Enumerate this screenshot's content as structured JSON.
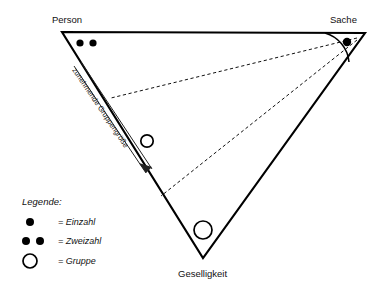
{
  "figure": {
    "type": "triangle-model-diagram",
    "background_color": "#ffffff",
    "line_color": "#000000"
  },
  "vertices": {
    "top_left": {
      "label": "Person",
      "symbol": "zweizahl",
      "symbol_description": "two filled dots",
      "x": 62,
      "y": 32
    },
    "top_right": {
      "label": "Sache",
      "symbol": "einzahl",
      "symbol_description": "one filled dot",
      "x": 365,
      "y": 33
    },
    "bottom": {
      "label": "Geselligkeit",
      "symbol": "gruppe",
      "symbol_description": "one open circle",
      "x": 203,
      "y": 258
    }
  },
  "interior_marks": [
    {
      "symbol": "gruppe",
      "symbol_description": "open circle in mid-left region",
      "x": 147,
      "y": 141
    }
  ],
  "axis_annotation": {
    "text": "zunehmende Gruppengröße",
    "direction": "from Person vertex toward Geselligkeit vertex",
    "arrow": "down-right"
  },
  "dashed_rays": {
    "origin": "Sache vertex",
    "count": 2,
    "targets": [
      "upper-left edge point",
      "lower-left edge point"
    ]
  },
  "angle_marker": {
    "at": "Sache vertex",
    "style": "solid arc"
  },
  "legend": {
    "title": "Legende:",
    "items": [
      {
        "symbol": "einzahl",
        "label": "= Einzahl"
      },
      {
        "symbol": "zweizahl",
        "label": "= Zweizahl"
      },
      {
        "symbol": "gruppe",
        "label": "= Gruppe"
      }
    ]
  }
}
